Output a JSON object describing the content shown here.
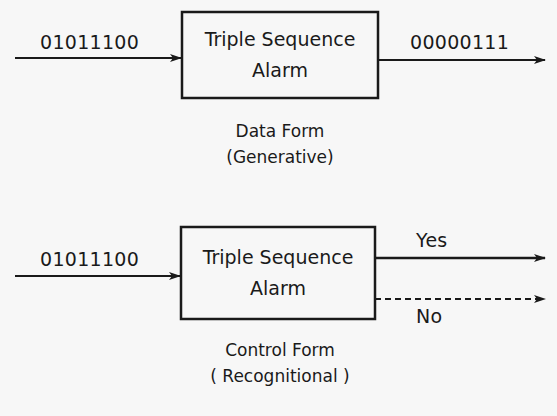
{
  "data_form": {
    "input_label": "01011100",
    "box_label_line1": "Triple Sequence",
    "box_label_line2": "Alarm",
    "output_label": "00000111",
    "caption_line1": "Data Form",
    "caption_line2": "(Generative)"
  },
  "control_form": {
    "input_label": "01011100",
    "box_label_line1": "Triple Sequence",
    "box_label_line2": "Alarm",
    "yes_label": "Yes",
    "no_label": "No",
    "caption_line1": "Control Form",
    "caption_line2": "( Recognitional )"
  },
  "colors": {
    "ink": "#1a1a1a",
    "background": "#f7f7f7"
  }
}
